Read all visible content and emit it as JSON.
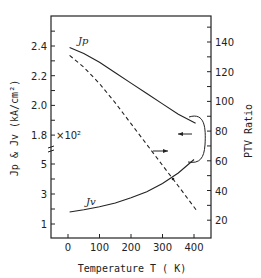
{
  "chart_data": {
    "type": "line",
    "title": "",
    "xlabel": "Temperature T ( K)",
    "ylabel_left": "Jp & Jv (kA/cm²)",
    "ylabel_right": "PTV Ratio",
    "x_ticks": [
      0,
      100,
      200,
      300,
      400
    ],
    "x_range": [
      -50,
      450
    ],
    "y_left_upper_ticks": [
      "2.4",
      "2.2",
      "2.0",
      "1.8"
    ],
    "y_left_upper_range": [
      1.7,
      2.6
    ],
    "y_left_lower_ticks": [
      "5",
      "3",
      "1"
    ],
    "y_left_lower_range": [
      0,
      6
    ],
    "y_left_lower_multiplier": "×10²",
    "y_right_ticks": [
      "140",
      "120",
      "100",
      "80",
      "60",
      "40",
      "20"
    ],
    "y_right_range": [
      10,
      160
    ],
    "grid": false,
    "legend": "inline curve labels",
    "series": [
      {
        "name": "Jp",
        "axis": "left-upper",
        "style": "solid",
        "x": [
          5,
          50,
          100,
          150,
          200,
          250,
          300,
          350,
          405
        ],
        "values": [
          2.39,
          2.35,
          2.29,
          2.22,
          2.15,
          2.08,
          2.01,
          1.94,
          1.88
        ]
      },
      {
        "name": "Jv",
        "axis": "left-lower",
        "style": "solid",
        "x": [
          5,
          50,
          100,
          150,
          200,
          250,
          300,
          350,
          400
        ],
        "values": [
          1.8,
          1.95,
          2.15,
          2.4,
          2.75,
          3.15,
          3.7,
          4.4,
          5.3
        ]
      },
      {
        "name": "PTV Ratio",
        "axis": "right",
        "style": "dashed",
        "x": [
          5,
          50,
          100,
          150,
          200,
          250,
          300,
          350,
          410
        ],
        "values": [
          131,
          123,
          112,
          99,
          85,
          71,
          57,
          43,
          26
        ]
      }
    ],
    "annotations": [
      {
        "text": "Jp",
        "near": "upper solid curve start"
      },
      {
        "text": "Jv",
        "near": "lower solid curve start"
      },
      {
        "text": "×10²",
        "near": "left axis break at 1.8"
      },
      {
        "text": "arrow-left",
        "meaning": "upper solid curve refers to left axis"
      },
      {
        "text": "arrow-right",
        "meaning": "dashed curve refers to right axis"
      }
    ]
  },
  "labels": {
    "curve_jp": "Jp",
    "curve_jv": "Jv",
    "multiplier": "×10²",
    "xlabel": "Temperature T ( K)",
    "ylabel_left": "Jp & Jv  (kA/cm²)",
    "ylabel_right": "PTV Ratio"
  }
}
